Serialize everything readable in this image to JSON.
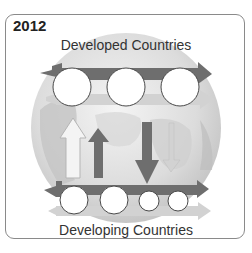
{
  "year": "2012",
  "top_label": "Developed Countries",
  "bottom_label": "Developing Countries",
  "colors": {
    "dark_arrow": "#6e6e6e",
    "light_arrow": "#c9c9c9",
    "globe_light": "#ececec",
    "globe_dark": "#c8c8c8",
    "circle_fill": "#ffffff",
    "circle_stroke": "#4a4a4a",
    "frame": "#8a8a8a"
  },
  "top_row": {
    "circles": [
      {
        "cx": 72,
        "cy": 87,
        "r": 19
      },
      {
        "cx": 126,
        "cy": 87,
        "r": 19
      },
      {
        "cx": 180,
        "cy": 87,
        "r": 19
      }
    ]
  },
  "bottom_row": {
    "circles": [
      {
        "cx": 74,
        "cy": 200,
        "r": 14
      },
      {
        "cx": 114,
        "cy": 200,
        "r": 14
      },
      {
        "cx": 149,
        "cy": 201,
        "r": 10
      },
      {
        "cx": 178,
        "cy": 201,
        "r": 10
      }
    ]
  },
  "vertical_arrows": [
    {
      "name": "hollow-up",
      "direction": "up"
    },
    {
      "name": "dark-up",
      "direction": "up"
    },
    {
      "name": "dark-down",
      "direction": "down"
    },
    {
      "name": "light-down",
      "direction": "down"
    }
  ]
}
